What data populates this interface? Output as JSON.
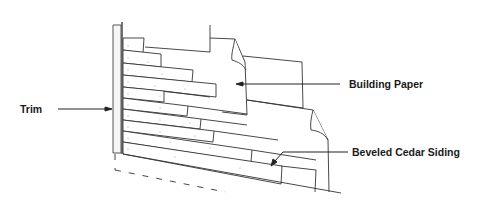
{
  "diagram": {
    "type": "exploded-construction-illustration",
    "labels": {
      "trim": "Trim",
      "building_paper": "Building Paper",
      "siding": "Beveled Cedar Siding"
    },
    "callouts": [
      {
        "label_key": "trim",
        "points_to": "vertical corner trim board",
        "arrow_direction": "right"
      },
      {
        "label_key": "building_paper",
        "points_to": "building paper sheet",
        "arrow_direction": "left"
      },
      {
        "label_key": "siding",
        "points_to": "lower siding course",
        "arrow_direction": "down-left"
      }
    ],
    "colors": {
      "line": "#333333",
      "text": "#1a1a1a",
      "background": "#ffffff",
      "trim_fill": "#f4f4f4"
    },
    "siding_course_count": 11
  }
}
